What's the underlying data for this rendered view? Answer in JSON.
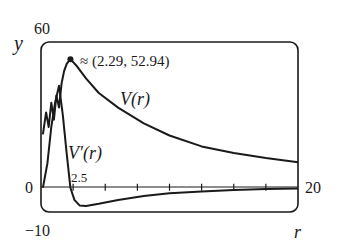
{
  "chart_data": {
    "type": "line",
    "title": "",
    "xlabel": "r",
    "ylabel": "y",
    "xlim": [
      0,
      20
    ],
    "ylim": [
      -10,
      60
    ],
    "x_tick_labels": {
      "left": "0",
      "tick": "2.5",
      "right": "20"
    },
    "y_tick_labels": {
      "top": "60",
      "bottom": "-10"
    },
    "x_ticks": [
      2.5,
      5,
      7.5,
      10,
      12.5,
      15,
      17.5
    ],
    "grid": false,
    "annotation": {
      "text": "≈ (2.29, 52.94)",
      "x": 2.29,
      "y": 52.94
    },
    "series": [
      {
        "name": "V(r)",
        "label": "V(r)",
        "x": [
          0.15,
          0.4,
          0.6,
          0.8,
          1.0,
          1.2,
          1.4,
          1.6,
          1.8,
          2.0,
          2.29,
          2.8,
          3.5,
          4.5,
          6.0,
          8.0,
          10.0,
          12.5,
          15.0,
          17.5,
          20.0
        ],
        "values": [
          22,
          31,
          25,
          35,
          28,
          38,
          33,
          43,
          48,
          51,
          52.94,
          50,
          45,
          39,
          33,
          26.5,
          21.5,
          17,
          14.3,
          12.2,
          10.5
        ]
      },
      {
        "name": "V'(r)",
        "label": "V′(r)",
        "x": [
          0.15,
          0.5,
          0.8,
          1.1,
          1.4,
          1.7,
          2.0,
          2.29,
          2.6,
          3.0,
          3.5,
          4.5,
          6.0,
          8.0,
          10.0,
          12.5,
          15.0,
          17.5,
          20.0
        ],
        "values": [
          0,
          10,
          25,
          35,
          42,
          30,
          14,
          0,
          -5,
          -7.3,
          -7.5,
          -6.6,
          -5.0,
          -3.4,
          -2.3,
          -1.5,
          -0.9,
          -0.5,
          -0.3
        ]
      }
    ]
  },
  "labels": {
    "y_axis": "y",
    "x_axis": "r",
    "y_top": "60",
    "y_bottom": "−10",
    "x_left": "0",
    "x_right": "20",
    "x_tick": "2.5",
    "annotation": "≈ (2.29, 52.94)",
    "series_v": "V(r)",
    "series_vprime": "V′(r)"
  }
}
